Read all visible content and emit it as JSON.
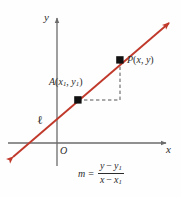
{
  "figure": {
    "type": "coordinate-plane-diagram",
    "background_color": "#fefefe"
  },
  "axes": {
    "x_label": "x",
    "y_label": "y",
    "origin_label": "O",
    "axis_color": "#6b6b6b",
    "x_axis": {
      "y_px": 143,
      "from_px": 8,
      "to_px": 170
    },
    "y_axis": {
      "x_px": 57,
      "from_px": 14,
      "to_px": 166
    }
  },
  "line": {
    "name_label": "ℓ",
    "color": "#c0392b",
    "double_arrow": true,
    "start_px": {
      "x": 10,
      "y": 160
    },
    "end_px": {
      "x": 172,
      "y": 20
    }
  },
  "points": [
    {
      "id": "A",
      "label_name": "A",
      "label_x": "x",
      "label_x_sub": "1",
      "label_y": "y",
      "label_y_sub": "1",
      "color": "#111111",
      "px": {
        "x": 78,
        "y": 100
      }
    },
    {
      "id": "P",
      "label_name": "P",
      "label_x": "x",
      "label_x_sub": "",
      "label_y": "y",
      "label_y_sub": "",
      "color": "#111111",
      "px": {
        "x": 120,
        "y": 60
      }
    }
  ],
  "guides": {
    "color": "#555555",
    "style": "dashed",
    "horizontal": {
      "from_px": {
        "x": 78,
        "y": 100
      },
      "to_px": {
        "x": 120,
        "y": 100
      }
    },
    "vertical": {
      "from_px": {
        "x": 120,
        "y": 100
      },
      "to_px": {
        "x": 120,
        "y": 60
      }
    }
  },
  "formula": {
    "lhs": "m",
    "equals": "=",
    "numerator": {
      "a": "y",
      "op": "−",
      "b": "y",
      "b_sub": "1"
    },
    "denominator": {
      "a": "x",
      "op": "−",
      "b": "x",
      "b_sub": "1"
    }
  }
}
